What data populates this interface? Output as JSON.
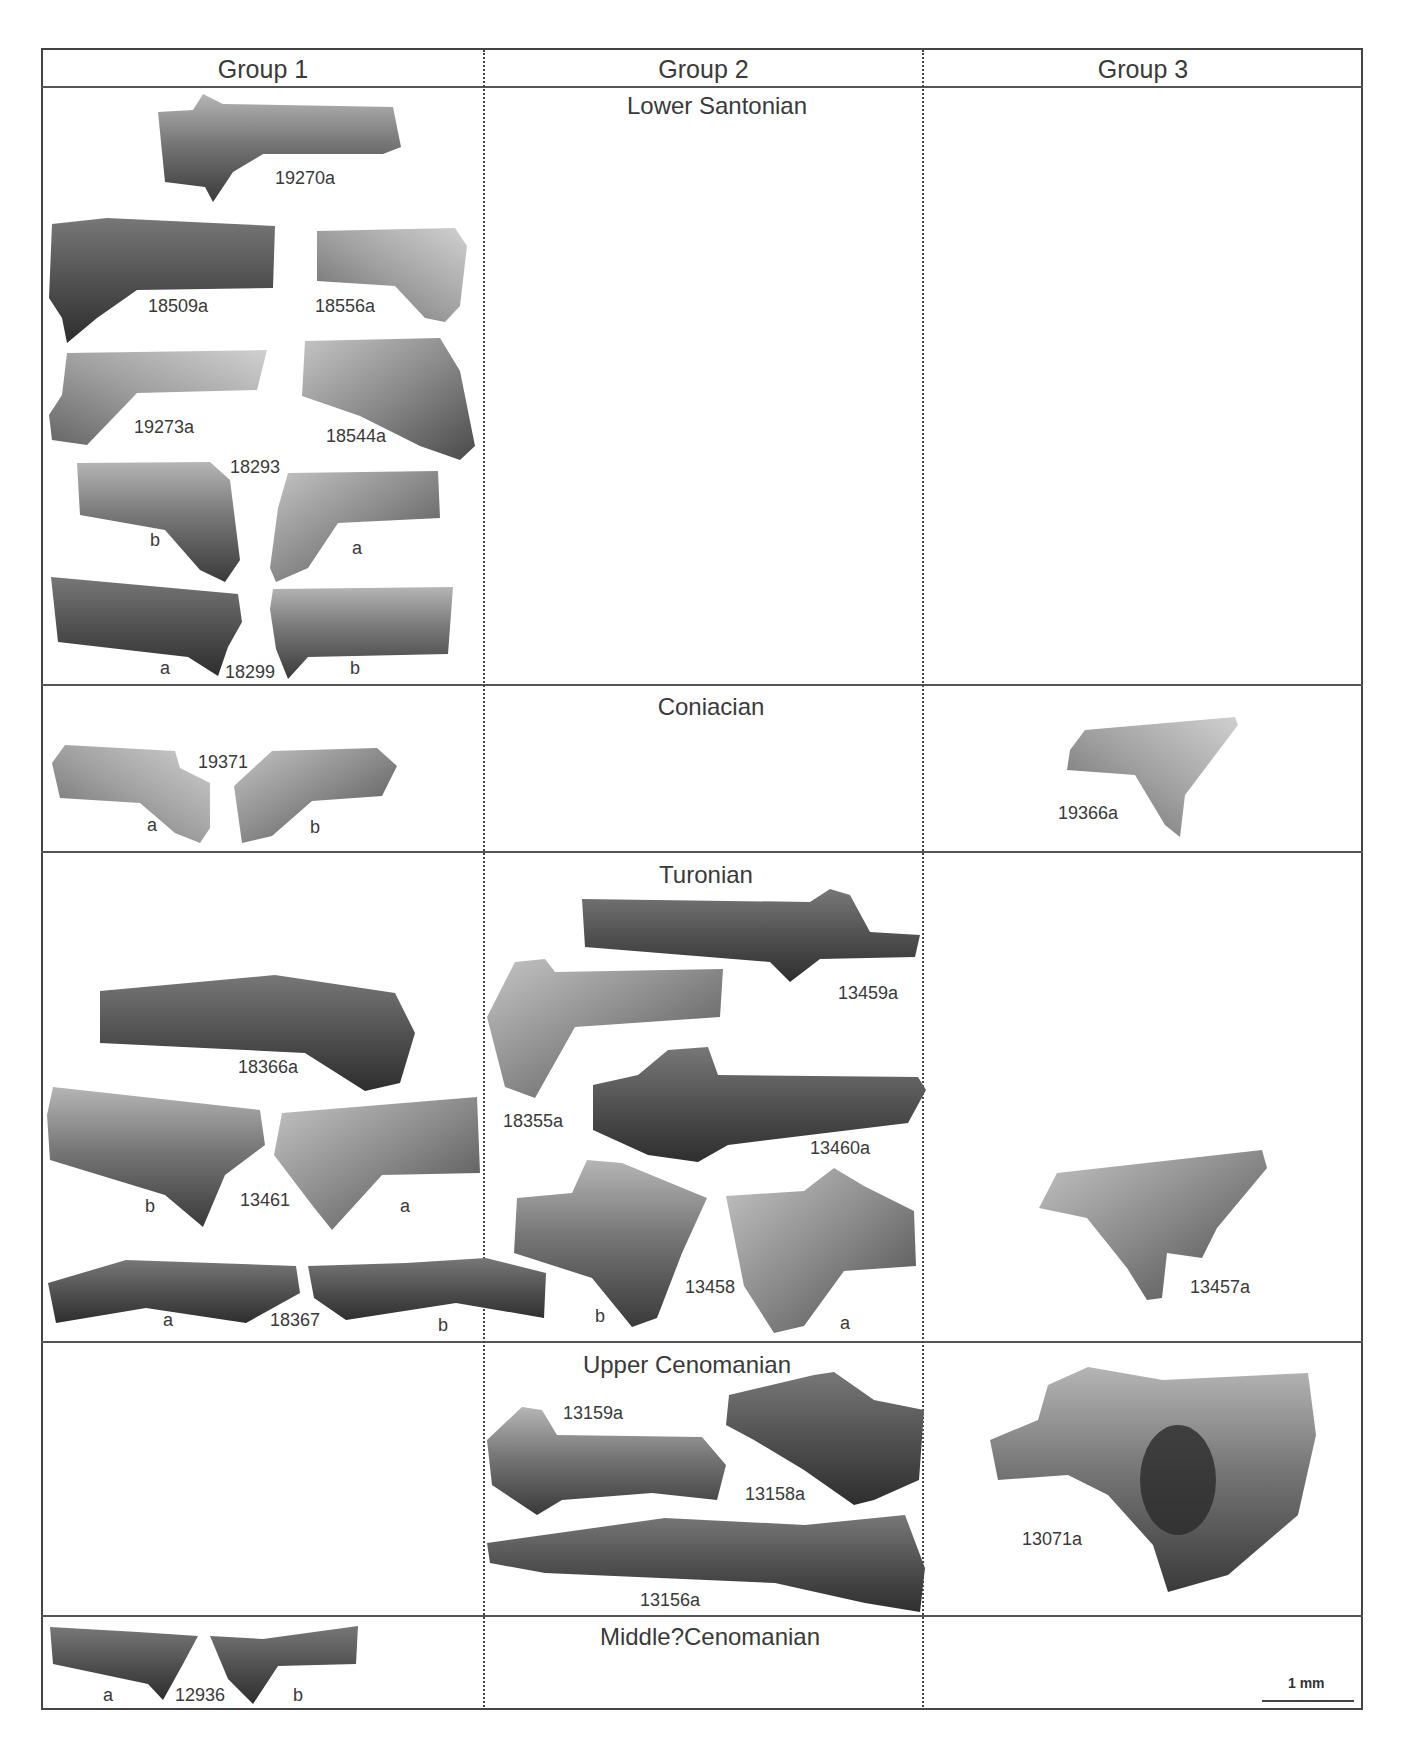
{
  "table": {
    "columns": [
      "Group 1",
      "Group 2",
      "Group 3"
    ],
    "rows": [
      {
        "stage": "Lower Santonian"
      },
      {
        "stage": "Coniacian"
      },
      {
        "stage": "Turonian"
      },
      {
        "stage": "Upper Cenomanian"
      },
      {
        "stage": "Middle?Cenomanian"
      }
    ]
  },
  "specimens": {
    "s19270a": "19270a",
    "s18509a": "18509a",
    "s18556a": "18556a",
    "s19273a": "19273a",
    "s18544a": "18544a",
    "s18293": "18293",
    "s18299": "18299",
    "s19371": "19371",
    "s19366a": "19366a",
    "s18366a": "18366a",
    "s13461": "13461",
    "s18367": "18367",
    "s13459a": "13459a",
    "s18355a": "18355a",
    "s13460a": "13460a",
    "s13458": "13458",
    "s13457a": "13457a",
    "s13159a": "13159a",
    "s13158a": "13158a",
    "s13156a": "13156a",
    "s13071a": "13071a",
    "s12936": "12936"
  },
  "views": {
    "a": "a",
    "b": "b"
  },
  "scale_bar": {
    "label": "1 mm"
  },
  "colors": {
    "line": "#444444",
    "text": "#3a3a3a",
    "fossil_dark": "#3c3c3c",
    "fossil_light": "#b8b8b8"
  }
}
